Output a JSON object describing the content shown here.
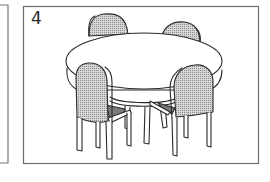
{
  "panels": [
    {
      "id": "partial-left",
      "label": ""
    },
    {
      "id": "main",
      "label": "4",
      "subject": "round table with four upholstered chairs"
    }
  ],
  "colors": {
    "frame": "#7a7a7a",
    "ink": "#2a2a2a",
    "upholstery": "#c9c9c9",
    "background": "#ffffff"
  },
  "icons": {
    "main_illustration": "table-with-chairs-illustration"
  }
}
